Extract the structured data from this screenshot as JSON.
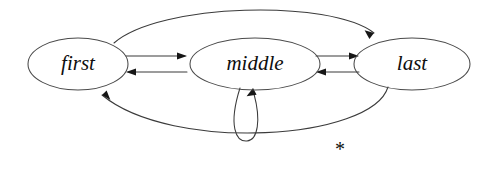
{
  "diagram": {
    "kind": "state-transition-diagram",
    "background_color": "#ffffff",
    "stroke_color": "#3b3b3b",
    "label_color": "#0e0e0e",
    "nodes": [
      {
        "id": "first",
        "label": "first",
        "cx": 78,
        "cy": 64,
        "rx": 50,
        "ry": 26
      },
      {
        "id": "middle",
        "label": "middle",
        "cx": 255,
        "cy": 64,
        "rx": 65,
        "ry": 26
      },
      {
        "id": "last",
        "label": "last",
        "cx": 412,
        "cy": 64,
        "rx": 58,
        "ry": 26
      }
    ],
    "edges": [
      {
        "id": "first-to-middle",
        "from": "first",
        "to": "middle",
        "label": "",
        "shape": "straight-upper"
      },
      {
        "id": "middle-to-first",
        "from": "middle",
        "to": "first",
        "label": "",
        "shape": "straight-lower"
      },
      {
        "id": "middle-to-last",
        "from": "middle",
        "to": "last",
        "label": "",
        "shape": "straight-upper"
      },
      {
        "id": "last-to-middle",
        "from": "last",
        "to": "middle",
        "label": "",
        "shape": "straight-lower"
      },
      {
        "id": "middle-self-loop",
        "from": "middle",
        "to": "middle",
        "label": "",
        "shape": "self-loop-below"
      },
      {
        "id": "first-to-last-arc",
        "from": "first",
        "to": "last",
        "label": "",
        "shape": "arc-above"
      },
      {
        "id": "last-to-first-arc",
        "from": "last",
        "to": "first",
        "label": "*",
        "shape": "arc-below"
      }
    ],
    "edge_labels": [
      {
        "id": "star-label",
        "text": "*",
        "x": 340,
        "y": 151
      }
    ]
  }
}
